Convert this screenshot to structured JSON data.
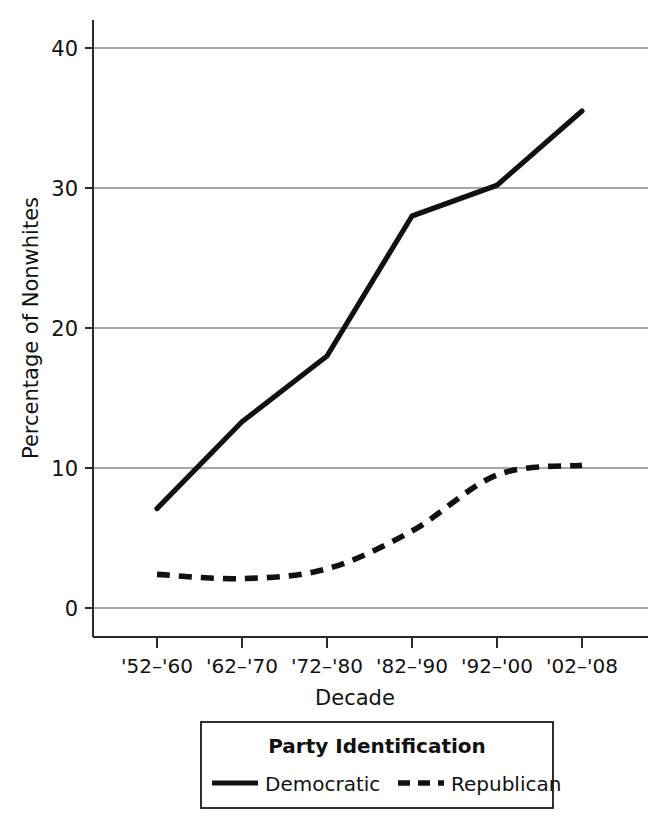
{
  "chart_data": {
    "type": "line",
    "title": "",
    "xlabel": "Decade",
    "ylabel": "Percentage of Nonwhites",
    "categories": [
      "'52–'60",
      "'62–'70",
      "'72–'80",
      "'82–'90",
      "'92–'00",
      "'02–'08"
    ],
    "series": [
      {
        "name": "Democratic",
        "style": "solid",
        "values": [
          7.1,
          13.3,
          18.0,
          28.0,
          30.2,
          35.5
        ]
      },
      {
        "name": "Republican",
        "style": "dashed",
        "values": [
          2.4,
          2.1,
          2.8,
          5.5,
          9.5,
          10.2
        ]
      }
    ],
    "ylim": [
      0,
      42
    ],
    "yticks": [
      0,
      10,
      20,
      30,
      40
    ],
    "ytick_labels": [
      "0",
      "10",
      "20",
      "30",
      "40"
    ],
    "grid": "horizontal",
    "legend_position": "below-axes",
    "line_color": "#111111",
    "grid_color": "#8a8a8a",
    "axis_color": "#2b2b2b"
  },
  "axes": {
    "y_axis_title": "Percentage of Nonwhites",
    "x_axis_title": "Decade",
    "y_tick_labels": [
      "40",
      "30",
      "20",
      "10",
      "0"
    ],
    "x_tick_labels": [
      "'52–'60",
      "'62–'70",
      "'72–'80",
      "'82–'90",
      "'92–'00",
      "'02–'08"
    ]
  },
  "legend": {
    "title": "Party Identification",
    "entries": [
      {
        "label": "Democratic",
        "line_style": "solid"
      },
      {
        "label": "Republican",
        "line_style": "dashed"
      }
    ]
  }
}
